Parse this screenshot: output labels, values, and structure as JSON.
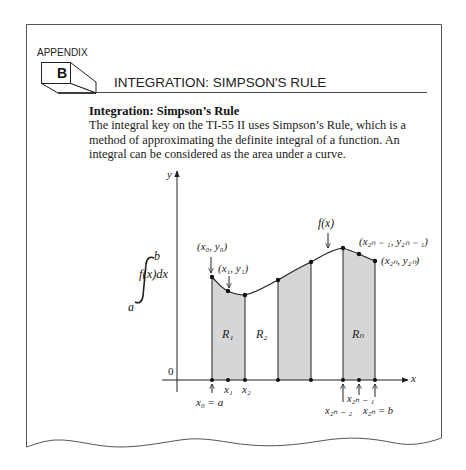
{
  "header": {
    "appendix_label": "APPENDIX",
    "appendix_letter": "B",
    "chapter_title": "INTEGRATION: SIMPSON'S RULE"
  },
  "section": {
    "heading": "Integration: Simpson’s Rule",
    "body": "The integral key on the TI-55 II uses Simpson’s Rule, which is a method of approximating the definite integral of a function. An integral can be considered as the area under a curve."
  },
  "figure": {
    "integral_upper": "b",
    "integral_lower": "a",
    "integral_expr": "f(x)dx",
    "axis_x_label": "x",
    "axis_y_label": "y",
    "origin_label": "0",
    "curve_label": "f(x)",
    "point_labels": {
      "p0": "(x₀, y₀)",
      "p1": "(x₁, y₁)",
      "p2n_minus_1": "(x₂ₙ ₋ ₁, y₂ₙ ₋ ₁)",
      "p2n": "(x₂ₙ, y₂ₙ)"
    },
    "region_labels": [
      "R₁",
      "R₂",
      "Rₙ"
    ],
    "tick_labels": {
      "x0": "x₀ = a",
      "x1": "x₁",
      "x2": "x₂",
      "x2n_minus_2": "x₂ₙ ₋ ₂",
      "x2n_minus_1": "x₂ₙ ₋ ₁",
      "x2n": "x₂ₙ = b"
    },
    "colors": {
      "shade": "#d4d4d4",
      "line": "#222222",
      "border": "#555555"
    }
  }
}
